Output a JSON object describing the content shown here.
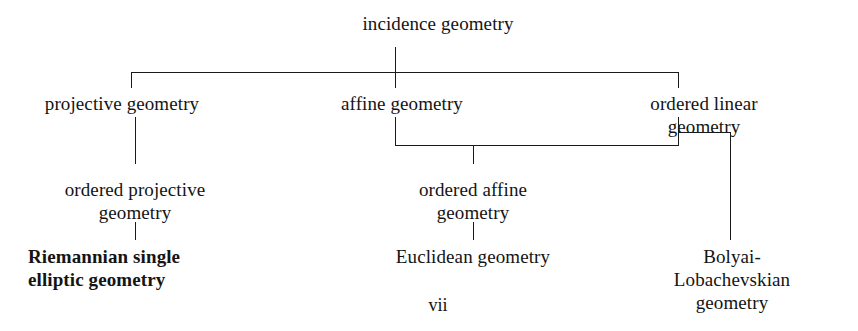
{
  "page": {
    "width": 858,
    "height": 331,
    "background": "#ffffff",
    "ink": "#1a1a1a",
    "text_color": "#141414",
    "folio": "vii"
  },
  "diagram": {
    "nodes": [
      {
        "id": "incidence",
        "label": "incidence geometry",
        "x": 438,
        "y": 12,
        "align": "ctr",
        "bold": false
      },
      {
        "id": "projective",
        "label": "projective geometry",
        "x": 122,
        "y": 92,
        "align": "ctr",
        "bold": false
      },
      {
        "id": "affine",
        "label": "affine geometry",
        "x": 402,
        "y": 92,
        "align": "ctr",
        "bold": false
      },
      {
        "id": "ordered-linear",
        "label": "ordered linear geometry",
        "x": 704,
        "y": 92,
        "align": "ctr",
        "bold": false
      },
      {
        "id": "ordered-projective",
        "label": "ordered projective\ngeometry",
        "x": 135,
        "y": 178,
        "align": "ctr",
        "bold": false
      },
      {
        "id": "ordered-affine",
        "label": "ordered affine\ngeometry",
        "x": 473,
        "y": 178,
        "align": "ctr",
        "bold": false
      },
      {
        "id": "riemannian",
        "label": "Riemannian single\nelliptic geometry",
        "x": 28,
        "y": 245,
        "align": "left",
        "bold": true
      },
      {
        "id": "euclidean",
        "label": "Euclidean geometry",
        "x": 473,
        "y": 245,
        "align": "ctr",
        "bold": false
      },
      {
        "id": "bolyai",
        "label": "Bolyai-Lobachevskian\ngeometry",
        "x": 732,
        "y": 245,
        "align": "ctr",
        "bold": false
      }
    ],
    "edges": [
      {
        "id": "incidence-drop",
        "type": "v",
        "x": 395,
        "y": 47,
        "length": 25
      },
      {
        "id": "tier1-rail",
        "type": "h",
        "x": 131,
        "y": 72,
        "length": 548
      },
      {
        "id": "rail1-to-projective",
        "type": "v",
        "x": 131,
        "y": 72,
        "length": 16
      },
      {
        "id": "rail1-to-affine",
        "type": "v",
        "x": 395,
        "y": 72,
        "length": 16
      },
      {
        "id": "rail1-to-ordlinear",
        "type": "v",
        "x": 678,
        "y": 72,
        "length": 16
      },
      {
        "id": "affine-drop",
        "type": "v",
        "x": 395,
        "y": 117,
        "length": 29
      },
      {
        "id": "ordlinear-drop",
        "type": "v",
        "x": 678,
        "y": 117,
        "length": 29
      },
      {
        "id": "tier2-rail",
        "type": "h",
        "x": 395,
        "y": 145,
        "length": 284
      },
      {
        "id": "rail2-to-ordaffine",
        "type": "v",
        "x": 473,
        "y": 145,
        "length": 19
      },
      {
        "id": "projective-drop",
        "type": "v",
        "x": 135,
        "y": 117,
        "length": 47
      },
      {
        "id": "ordprojective-drop",
        "type": "v",
        "x": 135,
        "y": 222,
        "length": 18
      },
      {
        "id": "ordaffine-drop",
        "type": "v",
        "x": 473,
        "y": 222,
        "length": 18
      },
      {
        "id": "ordlinear-branch-h",
        "type": "h",
        "x": 679,
        "y": 132,
        "length": 52
      },
      {
        "id": "bolyai-drop",
        "type": "v",
        "x": 730,
        "y": 132,
        "length": 108
      }
    ]
  }
}
